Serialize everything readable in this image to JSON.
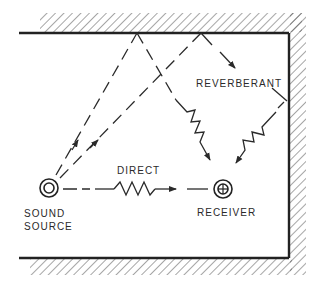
{
  "diagram": {
    "labels": {
      "reverberant": "REVERBERANT",
      "direct": "DIRECT",
      "source_line1": "SOUND",
      "source_line2": "SOURCE",
      "receiver": "RECEIVER"
    },
    "colors": {
      "ink": "#2a2a2a",
      "background": "#ffffff"
    },
    "nodes": [
      {
        "id": "sound-source",
        "symbol": "double-circle",
        "x": 49,
        "y": 188
      },
      {
        "id": "receiver",
        "symbol": "circle-with-cross",
        "x": 223,
        "y": 189
      }
    ],
    "paths": [
      {
        "id": "direct",
        "from": "sound-source",
        "to": "receiver",
        "style": "dashed-then-zigzag"
      },
      {
        "id": "reverberant-1",
        "from": "sound-source",
        "via": [
          "top-wall"
        ],
        "to": "receiver"
      },
      {
        "id": "reverberant-2",
        "from": "sound-source",
        "via": [
          "top-wall",
          "right-wall"
        ],
        "to": "receiver"
      }
    ]
  }
}
